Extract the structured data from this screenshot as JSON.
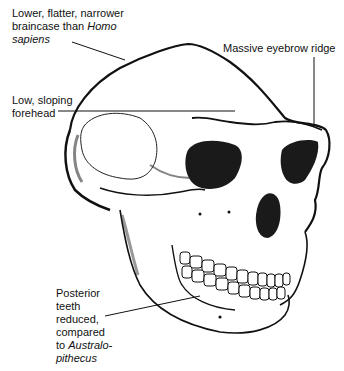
{
  "figure": {
    "labels": {
      "braincase": {
        "line1": "Lower, flatter, narrower",
        "line2a": "braincase than ",
        "line2b": "Homo",
        "line3": "sapiens"
      },
      "eyebrow": {
        "text": "Massive eyebrow ridge"
      },
      "forehead": {
        "line1": "Low, sloping",
        "line2": "forehead"
      },
      "teeth": {
        "line1": "Posterior",
        "line2": "teeth",
        "line3": "reduced,",
        "line4": "compared",
        "line5a": "to ",
        "line5b": "Australo-",
        "line6": "pithecus"
      }
    },
    "colors": {
      "ink": "#111111",
      "background": "#ffffff"
    }
  }
}
